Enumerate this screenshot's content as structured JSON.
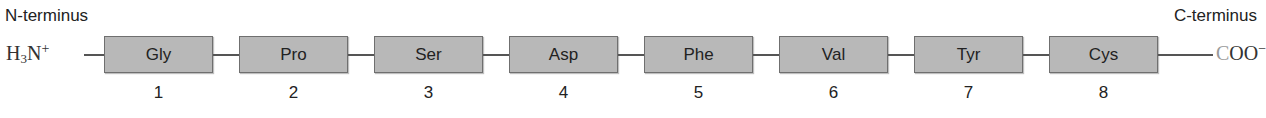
{
  "labels": {
    "n_terminus": "N-terminus",
    "c_terminus": "C-terminus",
    "n_group": {
      "base": "H",
      "sub": "3",
      "atom": "N",
      "charge": "+"
    },
    "c_group": {
      "c": "C",
      "rest": "OO",
      "charge": "−"
    }
  },
  "residues": [
    {
      "name": "Gly",
      "position": "1"
    },
    {
      "name": "Pro",
      "position": "2"
    },
    {
      "name": "Ser",
      "position": "3"
    },
    {
      "name": "Asp",
      "position": "4"
    },
    {
      "name": "Phe",
      "position": "5"
    },
    {
      "name": "Val",
      "position": "6"
    },
    {
      "name": "Tyr",
      "position": "7"
    },
    {
      "name": "Cys",
      "position": "8"
    }
  ],
  "colors": {
    "box_fill": "#b8b8b8",
    "box_border": "#6f6f6f",
    "bond": "#555555"
  }
}
